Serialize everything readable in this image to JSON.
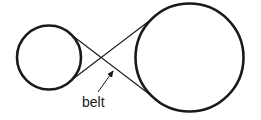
{
  "diagram": {
    "type": "crossed belt drive",
    "colors": {
      "stroke": "#1a1a1a",
      "background": "#ffffff"
    },
    "pulleys": [
      {
        "name": "small-pulley",
        "cx": 49,
        "cy": 57.5,
        "r": 32
      },
      {
        "name": "large-pulley",
        "cx": 189.5,
        "cy": 57.5,
        "r": 54
      }
    ],
    "belt_segments": [
      {
        "x1": 69,
        "y1": 33,
        "x2": 157,
        "y2": 100
      },
      {
        "x1": 69,
        "y1": 82,
        "x2": 157,
        "y2": 15
      }
    ],
    "annotation": {
      "label": "belt",
      "text_x": 82,
      "text_y": 107,
      "arrow": {
        "x1": 98,
        "y1": 92,
        "x2": 114,
        "y2": 70
      }
    }
  }
}
